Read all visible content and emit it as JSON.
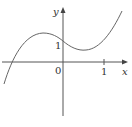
{
  "figure": {
    "type": "function-graph",
    "axes": {
      "x_label": "x",
      "y_label": "y",
      "origin_label": "0",
      "x_tick_label": "1",
      "y_tick_label": "1"
    },
    "curve": {
      "shape": "cubic",
      "description": "Cubic curve rising from lower left, local max left of y-axis, y-intercept near 1, local min right of origin, rising to upper right"
    },
    "colors": {
      "axis": "#555555",
      "curve": "#666666",
      "text": "#333333"
    }
  }
}
